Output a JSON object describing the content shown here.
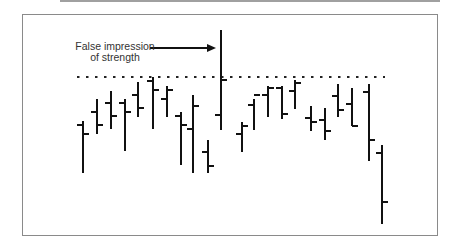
{
  "chart_data": {
    "type": "bar",
    "subtype": "ohlc",
    "title": "",
    "xlabel": "",
    "ylabel": "",
    "grid": false,
    "annotation": {
      "text_lines": [
        "False impression",
        "of strength"
      ],
      "arrow_target_bar": 11
    },
    "reference_line": {
      "style": "dotted",
      "level_px": 77,
      "description": "resistance level"
    },
    "pixel_scale_note": "values are screen y-coordinates (smaller = higher price)",
    "bars": [
      {
        "x": 83,
        "high": 121,
        "low": 173,
        "open": 125,
        "close": 134
      },
      {
        "x": 97,
        "high": 99,
        "low": 134,
        "open": 112,
        "close": 125
      },
      {
        "x": 111,
        "high": 91,
        "low": 129,
        "open": 103,
        "close": 116
      },
      {
        "x": 125,
        "high": 99,
        "low": 151,
        "open": 103,
        "close": 112
      },
      {
        "x": 138,
        "high": 82,
        "low": 117,
        "open": 95,
        "close": 108
      },
      {
        "x": 153,
        "high": 77,
        "low": 129,
        "open": 81,
        "close": 90
      },
      {
        "x": 167,
        "high": 86,
        "low": 117,
        "open": 99,
        "close": 90
      },
      {
        "x": 181,
        "high": 112,
        "low": 165,
        "open": 116,
        "close": 125
      },
      {
        "x": 193,
        "high": 95,
        "low": 173,
        "open": 129,
        "close": 106
      },
      {
        "x": 208,
        "high": 140,
        "low": 173,
        "open": 152,
        "close": 166
      },
      {
        "x": 221,
        "high": 30,
        "low": 130,
        "open": 115,
        "close": 80
      },
      {
        "x": 242,
        "high": 122,
        "low": 152,
        "open": 134,
        "close": 126
      },
      {
        "x": 254,
        "high": 99,
        "low": 130,
        "open": 105,
        "close": 95
      },
      {
        "x": 268,
        "high": 86,
        "low": 117,
        "open": 95,
        "close": 88
      },
      {
        "x": 282,
        "high": 86,
        "low": 119,
        "open": 88,
        "close": 114
      },
      {
        "x": 295,
        "high": 80,
        "low": 109,
        "open": 91,
        "close": 83
      },
      {
        "x": 311,
        "high": 106,
        "low": 131,
        "open": 118,
        "close": 122
      },
      {
        "x": 325,
        "high": 108,
        "low": 140,
        "open": 120,
        "close": 131
      },
      {
        "x": 338,
        "high": 84,
        "low": 117,
        "open": 96,
        "close": 110
      },
      {
        "x": 352,
        "high": 88,
        "low": 126,
        "open": 104,
        "close": 126
      },
      {
        "x": 369,
        "high": 84,
        "low": 161,
        "open": 92,
        "close": 140
      },
      {
        "x": 382,
        "high": 145,
        "low": 224,
        "open": 153,
        "close": 202
      }
    ]
  },
  "annotation": {
    "line1": "False impression",
    "line2": "of strength"
  },
  "style": {
    "bar_color": "#111111",
    "dotted_color": "#222222",
    "frame_color": "#8a8a8a"
  }
}
